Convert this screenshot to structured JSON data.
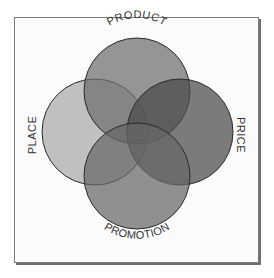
{
  "diagram": {
    "type": "venn",
    "title": "",
    "sets": [
      {
        "id": "product",
        "label": "PRODUCT",
        "color": "#7c7c7c"
      },
      {
        "id": "place",
        "label": "PLACE",
        "color": "#ababab"
      },
      {
        "id": "price",
        "label": "PRICE",
        "color": "#5a5a5a"
      },
      {
        "id": "promotion",
        "label": "PROMOTION",
        "color": "#747474"
      }
    ],
    "labels": {
      "product": "PRODUCT",
      "place": "PLACE",
      "price": "PRICE",
      "promotion": "PROMOTION"
    }
  }
}
